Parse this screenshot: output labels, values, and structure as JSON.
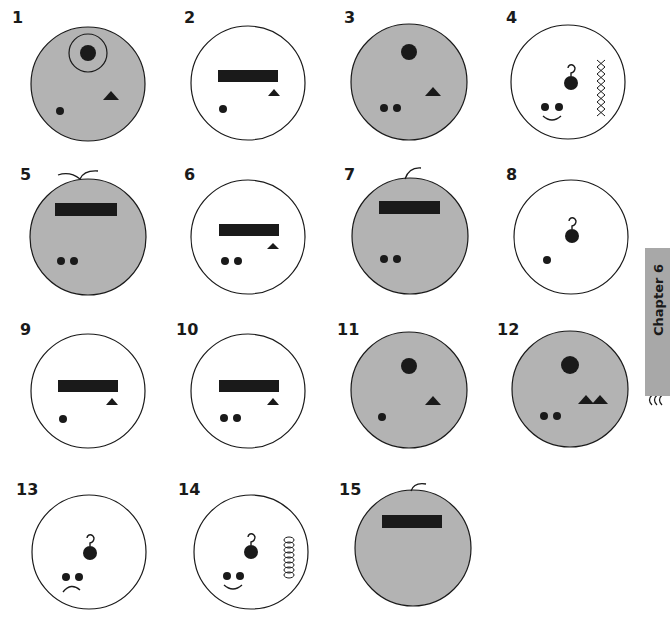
{
  "page": {
    "background": "#ffffff",
    "colors": {
      "cell_gray": "#b3b3b3",
      "cell_white": "#ffffff",
      "outline": "#1a1a1a",
      "ink": "#1a1a1a",
      "tab_gray": "#a8a8a8"
    }
  },
  "chapter_tab": {
    "label": "Chapter 6",
    "icon": "wavy-lines-icon"
  },
  "figures": [
    {
      "label": "1",
      "fill": "gray",
      "features": [
        "nucleus-with-membrane",
        "triangle",
        "single-dot"
      ]
    },
    {
      "label": "2",
      "fill": "white",
      "features": [
        "bar",
        "small-triangle",
        "single-dot"
      ]
    },
    {
      "label": "3",
      "fill": "gray",
      "features": [
        "nucleus",
        "triangle",
        "double-dot"
      ]
    },
    {
      "label": "4",
      "fill": "white",
      "features": [
        "hooked-nucleus",
        "zigzag-chain",
        "double-dot",
        "smile"
      ]
    },
    {
      "label": "5",
      "fill": "gray",
      "features": [
        "two-flagella",
        "bar",
        "double-dot"
      ]
    },
    {
      "label": "6",
      "fill": "white",
      "features": [
        "bar",
        "small-triangle",
        "double-dot"
      ]
    },
    {
      "label": "7",
      "fill": "gray",
      "features": [
        "one-flagellum",
        "bar",
        "double-dot"
      ]
    },
    {
      "label": "8",
      "fill": "white",
      "features": [
        "hooked-nucleus",
        "single-dot"
      ]
    },
    {
      "label": "9",
      "fill": "white",
      "features": [
        "bar",
        "small-triangle",
        "single-dot"
      ]
    },
    {
      "label": "10",
      "fill": "white",
      "features": [
        "bar",
        "small-triangle",
        "double-dot"
      ]
    },
    {
      "label": "11",
      "fill": "gray",
      "features": [
        "nucleus",
        "triangle",
        "single-dot"
      ]
    },
    {
      "label": "12",
      "fill": "gray",
      "features": [
        "nucleus",
        "two-triangles",
        "double-dot"
      ]
    },
    {
      "label": "13",
      "fill": "white",
      "features": [
        "hooked-nucleus",
        "double-dot",
        "frown"
      ]
    },
    {
      "label": "14",
      "fill": "white",
      "features": [
        "hooked-nucleus",
        "coil",
        "double-dot",
        "smile"
      ]
    },
    {
      "label": "15",
      "fill": "gray",
      "features": [
        "one-flagellum",
        "bar"
      ]
    }
  ]
}
